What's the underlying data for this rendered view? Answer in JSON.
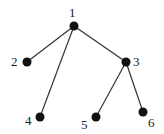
{
  "diagram": {
    "type": "tree",
    "node_color": "#111111",
    "edge_color": "#333333",
    "nodes": [
      {
        "id": "1",
        "label": "1",
        "x": 74,
        "y": 26,
        "lx": 69,
        "ly": 17
      },
      {
        "id": "2",
        "label": "2",
        "x": 27,
        "y": 62,
        "lx": 11,
        "ly": 66
      },
      {
        "id": "3",
        "label": "3",
        "x": 126,
        "y": 62,
        "lx": 133,
        "ly": 66
      },
      {
        "id": "4",
        "label": "4",
        "x": 40,
        "y": 117,
        "lx": 25,
        "ly": 125
      },
      {
        "id": "5",
        "label": "5",
        "x": 96,
        "y": 117,
        "lx": 81,
        "ly": 129
      },
      {
        "id": "6",
        "label": "6",
        "x": 143,
        "y": 112,
        "lx": 148,
        "ly": 127
      }
    ],
    "edges": [
      {
        "from": "1",
        "to": "2"
      },
      {
        "from": "1",
        "to": "4"
      },
      {
        "from": "1",
        "to": "3"
      },
      {
        "from": "3",
        "to": "5"
      },
      {
        "from": "3",
        "to": "6"
      }
    ]
  }
}
